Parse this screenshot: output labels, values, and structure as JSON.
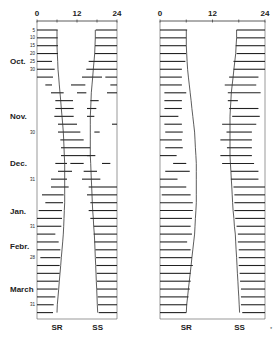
{
  "chart_data": {
    "type": "bar",
    "title": "",
    "xlabel": "Hour of day",
    "x_ticks": [
      "0",
      "12",
      "24"
    ],
    "xlim": [
      0,
      24
    ],
    "months": [
      "Oct.",
      "Nov.",
      "Dec.",
      "Jan.",
      "Febr.",
      "March"
    ],
    "day_labels": [
      "5",
      "10",
      "15",
      "20",
      "25",
      "30",
      "30",
      "31",
      "31",
      "28",
      "31"
    ],
    "curve_labels": [
      "SR",
      "SS"
    ],
    "grid": false,
    "rows": 37,
    "panels": [
      {
        "name": "left",
        "sunrise": [
          6,
          6,
          6,
          6.1,
          6.2,
          6.3,
          6.5,
          6.7,
          6.9,
          7.1,
          7.3,
          7.5,
          7.7,
          7.9,
          8.0,
          8.1,
          8.2,
          8.3,
          8.3,
          8.3,
          8.3,
          8.3,
          8.3,
          8.2,
          8.1,
          8.0,
          7.9,
          7.7,
          7.5,
          7.3,
          7.1,
          6.9,
          6.7,
          6.5,
          6.3,
          6.1,
          6.0
        ],
        "sunset": [
          17.5,
          17.5,
          17.4,
          17.3,
          17.1,
          16.9,
          16.7,
          16.5,
          16.3,
          16.2,
          16.1,
          16.0,
          16.0,
          16.0,
          16.0,
          16.0,
          16.0,
          16.1,
          16.2,
          16.3,
          16.4,
          16.5,
          16.6,
          16.7,
          16.9,
          17.0,
          17.2,
          17.3,
          17.4,
          17.5,
          17.6,
          17.7,
          17.8,
          17.9,
          18.0,
          18.1,
          18.2
        ],
        "segments": [
          [
            [
              0,
              6.2
            ],
            [
              17.6,
              24
            ]
          ],
          [
            [
              0,
              6.2
            ],
            [
              17.5,
              24
            ]
          ],
          [
            [
              0,
              6.3
            ],
            [
              17.4,
              24
            ]
          ],
          [
            [
              0,
              6.3
            ],
            [
              17.3,
              24
            ]
          ],
          [
            [
              0,
              4.5
            ],
            [
              15.5,
              24
            ]
          ],
          [
            [
              0,
              5.3
            ],
            [
              14.8,
              24
            ]
          ],
          [
            [
              0,
              4.8
            ],
            [
              13.5,
              19.5
            ],
            [
              20.5,
              24
            ]
          ],
          [
            [
              2.5,
              4.5
            ],
            [
              10.2,
              14.5
            ],
            [
              22,
              24
            ]
          ],
          [
            [
              4.2,
              8.0
            ],
            [
              12.0,
              14.8
            ],
            [
              21,
              24
            ]
          ],
          [
            [
              5.5,
              10.8
            ],
            [
              16.0,
              18.5
            ]
          ],
          [
            [
              5.5,
              11.0
            ],
            [
              15.0,
              17.8
            ]
          ],
          [
            [
              5.2,
              11.0
            ],
            [
              15.0,
              17.2
            ]
          ],
          [
            [
              6.3,
              12.0
            ],
            [
              22.5,
              24
            ]
          ],
          [
            [
              6.3,
              13.0
            ],
            [
              17.2,
              18.8
            ]
          ],
          [
            [
              7.0,
              14.0
            ]
          ],
          [
            [
              7.2,
              16.0
            ]
          ],
          [
            [
              7.2,
              16.0
            ],
            [
              15.0,
              17.5
            ]
          ],
          [
            [
              5.5,
              9.0
            ],
            [
              10.0,
              14.0
            ],
            [
              19.5,
              22.0
            ]
          ],
          [
            [
              6.3,
              10.5
            ],
            [
              14.0,
              18.0
            ]
          ],
          [
            [
              4.2,
              9.0
            ],
            [
              13.5,
              19.0
            ]
          ],
          [
            [
              4.2,
              9.5
            ],
            [
              15.5,
              24
            ]
          ],
          [
            [
              1.5,
              8.0
            ],
            [
              15.0,
              24
            ]
          ],
          [
            [
              2.5,
              7.8
            ],
            [
              16.0,
              24
            ]
          ],
          [
            [
              0.5,
              7.5
            ],
            [
              15.5,
              24
            ]
          ],
          [
            [
              0,
              7.5
            ],
            [
              16.0,
              24
            ]
          ],
          [
            [
              0,
              7.3
            ],
            [
              17.0,
              24
            ]
          ],
          [
            [
              0,
              5.5
            ],
            [
              17.0,
              24
            ]
          ],
          [
            [
              0,
              6.5
            ],
            [
              17.2,
              24
            ]
          ],
          [
            [
              0,
              7.0
            ],
            [
              17.5,
              24
            ]
          ],
          [
            [
              1.0,
              7.0
            ],
            [
              17.7,
              24
            ]
          ],
          [
            [
              0,
              6.8
            ],
            [
              17.8,
              24
            ]
          ],
          [
            [
              0,
              6.8
            ],
            [
              17.9,
              24
            ]
          ],
          [
            [
              0,
              6.5
            ],
            [
              18.0,
              24
            ]
          ],
          [
            [
              0,
              6.2
            ],
            [
              18.0,
              24
            ]
          ],
          [
            [
              0,
              5.5
            ],
            [
              18.2,
              24
            ]
          ],
          [
            [
              0,
              5.0
            ],
            [
              18.3,
              24
            ]
          ],
          [
            [
              0,
              4.8
            ],
            [
              18.5,
              24
            ]
          ]
        ]
      },
      {
        "name": "right",
        "sunrise": [
          6,
          6,
          6,
          6.1,
          6.2,
          6.3,
          6.5,
          6.7,
          6.9,
          7.1,
          7.3,
          7.5,
          7.7,
          7.9,
          8.0,
          8.1,
          8.2,
          8.3,
          8.3,
          8.3,
          8.3,
          8.3,
          8.3,
          8.2,
          8.1,
          8.0,
          7.9,
          7.7,
          7.5,
          7.3,
          7.1,
          6.9,
          6.7,
          6.5,
          6.3,
          6.1,
          6.0
        ],
        "sunset": [
          17.5,
          17.5,
          17.4,
          17.3,
          17.1,
          16.9,
          16.7,
          16.5,
          16.3,
          16.2,
          16.1,
          16.0,
          16.0,
          16.0,
          16.0,
          16.0,
          16.0,
          16.1,
          16.2,
          16.3,
          16.4,
          16.5,
          16.6,
          16.7,
          16.9,
          17.0,
          17.2,
          17.3,
          17.4,
          17.5,
          17.6,
          17.7,
          17.8,
          17.9,
          18.0,
          18.1,
          18.2
        ],
        "segments": [
          [
            [
              0,
              6.2
            ],
            [
              17.5,
              24
            ]
          ],
          [
            [
              0,
              6.0
            ],
            [
              17.6,
              24
            ]
          ],
          [
            [
              0,
              6.0
            ],
            [
              17.3,
              24
            ]
          ],
          [
            [
              0,
              6.0
            ],
            [
              17.5,
              24
            ]
          ],
          [
            [
              0,
              5.8
            ],
            [
              16.8,
              24
            ]
          ],
          [
            [
              0,
              5.0
            ],
            [
              16.8,
              24
            ]
          ],
          [
            [
              0,
              5.0
            ],
            [
              15.8,
              22.5
            ]
          ],
          [
            [
              0,
              5.0
            ],
            [
              14.8,
              22.0
            ]
          ],
          [
            [
              1.0,
              6.0
            ],
            [
              15.5,
              23.0
            ]
          ],
          [
            [
              1.0,
              5.0
            ],
            [
              15.5,
              17.8
            ]
          ],
          [
            [
              1.0,
              5.0
            ],
            [
              15.8,
              22.5
            ]
          ],
          [
            [
              0,
              4.2
            ],
            [
              16.5,
              22.8
            ]
          ],
          [
            [
              1.0,
              5.0
            ],
            [
              14.2,
              22.0
            ]
          ],
          [
            [
              1.2,
              5.2
            ],
            [
              15.2,
              21.0
            ]
          ],
          [
            [
              0,
              5.0
            ],
            [
              13.8,
              21.0
            ]
          ],
          [
            [
              1.2,
              5.2
            ],
            [
              15.3,
              21.0
            ]
          ],
          [
            [
              0,
              3.8
            ],
            [
              13.8,
              21.0
            ]
          ],
          [
            [
              3.0,
              6.0
            ],
            [
              14.2,
              21.5
            ]
          ],
          [
            [
              1.2,
              6.8
            ],
            [
              16.2,
              22.5
            ]
          ],
          [
            [
              0,
              4.0
            ],
            [
              16.2,
              22.5
            ]
          ],
          [
            [
              0,
              6.0
            ],
            [
              16.8,
              24
            ]
          ],
          [
            [
              0.4,
              7.0
            ],
            [
              17.0,
              24
            ]
          ],
          [
            [
              0,
              7.5
            ],
            [
              17.0,
              24
            ]
          ],
          [
            [
              0,
              7.5
            ],
            [
              17.0,
              24
            ]
          ],
          [
            [
              0,
              7.3
            ],
            [
              17.2,
              24
            ]
          ],
          [
            [
              0,
              7.0
            ],
            [
              17.5,
              24
            ]
          ],
          [
            [
              0,
              7.3
            ],
            [
              17.8,
              24
            ]
          ],
          [
            [
              0,
              6.2
            ],
            [
              17.8,
              24
            ]
          ],
          [
            [
              0,
              7.0
            ],
            [
              18.0,
              24
            ]
          ],
          [
            [
              0,
              7.3
            ],
            [
              18.0,
              24
            ]
          ],
          [
            [
              0,
              7.5
            ],
            [
              18.0,
              24
            ]
          ],
          [
            [
              0,
              7.0
            ],
            [
              18.2,
              24
            ]
          ],
          [
            [
              0,
              7.0
            ],
            [
              18.3,
              24
            ]
          ],
          [
            [
              0,
              6.8
            ],
            [
              18.5,
              24
            ]
          ],
          [
            [
              0,
              6.5
            ],
            [
              18.5,
              24
            ]
          ],
          [
            [
              0,
              6.2
            ],
            [
              18.5,
              24
            ]
          ],
          [
            [
              0,
              6.0
            ],
            [
              18.8,
              24
            ]
          ]
        ]
      }
    ]
  },
  "layout": {
    "row_top": 30,
    "row_step": 7.85,
    "axis_y": 21,
    "bottom_y": 319,
    "panels_px": [
      {
        "x0": 37,
        "x1": 117
      },
      {
        "x0": 160,
        "x1": 265
      }
    ]
  },
  "labels": {
    "ticks": [
      "0",
      "12",
      "24"
    ],
    "months": [
      {
        "text": "Oct.",
        "row": 4
      },
      {
        "text": "Nov.",
        "row": 11
      },
      {
        "text": "Dec.",
        "row": 17
      },
      {
        "text": "Jan.",
        "row": 23
      },
      {
        "text": "Febr.",
        "row": 27.5
      },
      {
        "text": "March",
        "row": 33
      }
    ],
    "days": [
      {
        "text": "5",
        "row": 0
      },
      {
        "text": "10",
        "row": 1
      },
      {
        "text": "15",
        "row": 2
      },
      {
        "text": "20",
        "row": 3
      },
      {
        "text": "25",
        "row": 4
      },
      {
        "text": "30",
        "row": 5
      },
      {
        "text": "30",
        "row": 13
      },
      {
        "text": "31",
        "row": 19
      },
      {
        "text": "31",
        "row": 25
      },
      {
        "text": "28",
        "row": 29
      },
      {
        "text": "31",
        "row": 35
      }
    ],
    "footer": [
      "SR",
      "SS"
    ],
    "corner_mark": "*"
  }
}
